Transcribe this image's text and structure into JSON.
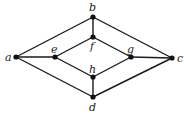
{
  "diagram": {
    "type": "graph",
    "nodes": [
      {
        "id": "a",
        "label": "a",
        "x": 16,
        "y": 57,
        "lx": 5,
        "ly": 61
      },
      {
        "id": "b",
        "label": "b",
        "x": 93,
        "y": 17,
        "lx": 89,
        "ly": 11
      },
      {
        "id": "c",
        "label": "c",
        "x": 172,
        "y": 58,
        "lx": 177,
        "ly": 62
      },
      {
        "id": "d",
        "label": "d",
        "x": 93,
        "y": 97,
        "lx": 89,
        "ly": 111
      },
      {
        "id": "e",
        "label": "e",
        "x": 55,
        "y": 57,
        "lx": 51,
        "ly": 53
      },
      {
        "id": "f",
        "label": "f",
        "x": 93,
        "y": 37,
        "lx": 90,
        "ly": 50
      },
      {
        "id": "g",
        "label": "g",
        "x": 131,
        "y": 57,
        "lx": 127,
        "ly": 53
      },
      {
        "id": "h",
        "label": "h",
        "x": 93,
        "y": 77,
        "lx": 89,
        "ly": 73
      }
    ],
    "edges": [
      [
        "a",
        "b"
      ],
      [
        "a",
        "e"
      ],
      [
        "a",
        "d"
      ],
      [
        "b",
        "f"
      ],
      [
        "b",
        "c"
      ],
      [
        "e",
        "f"
      ],
      [
        "e",
        "h"
      ],
      [
        "f",
        "g"
      ],
      [
        "h",
        "g"
      ],
      [
        "g",
        "c"
      ],
      [
        "h",
        "d"
      ],
      [
        "d",
        "c"
      ]
    ]
  }
}
